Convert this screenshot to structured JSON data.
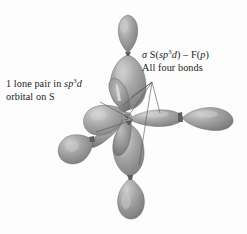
{
  "figure": {
    "background_color": "#fdfdfd",
    "lobe_fill": "#9a9a9a",
    "lobe_highlight": "#c8c8c8",
    "lobe_shadow": "#6f6f6f",
    "leader_line_color": "#55555a",
    "text_color": "#1b1b1b"
  },
  "labels": {
    "lone_pair": {
      "line1_prefix": "1 lone pair in ",
      "line1_italic": "sp",
      "line1_sup": "3",
      "line1_italic2": "d",
      "line2": "orbital on S"
    },
    "sigma_bond": {
      "line1_sigma": "σ",
      "line1_s": " S(",
      "line1_italic": "sp",
      "line1_sup": "3",
      "line1_italic2": "d",
      "line1_mid": ") – F(",
      "line1_italic3": "p",
      "line1_end": ")",
      "line2": "All four bonds"
    }
  },
  "atoms": {
    "center_label": "S"
  },
  "orbitals": [
    {
      "name": "orbital-up",
      "direction": "up",
      "big_lobe": true,
      "small_lobe": true
    },
    {
      "name": "orbital-down",
      "direction": "down",
      "big_lobe": true,
      "small_lobe": true
    },
    {
      "name": "orbital-right",
      "direction": "right",
      "big_lobe": true,
      "small_lobe": true
    },
    {
      "name": "orbital-lower-left",
      "direction": "lower-left",
      "big_lobe": true,
      "small_lobe": true
    },
    {
      "name": "orbital-lone-pair",
      "direction": "left",
      "big_lobe": true,
      "small_lobe": false
    }
  ]
}
